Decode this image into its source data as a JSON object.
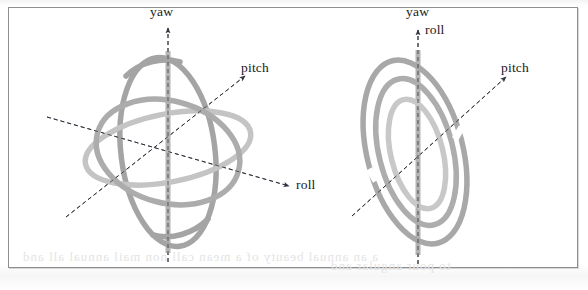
{
  "figure": {
    "caption_present": false,
    "background": "#ffffff",
    "frame_color": "#8e8e8e",
    "panels": [
      {
        "id": "left",
        "name": "gyroscope-normal",
        "description": "Three-axis gimbal with three interlocking rings in general orientation",
        "ring_colors": [
          "#a9a9a9",
          "#b4b4b4",
          "#c9c9c9"
        ],
        "rod_color": "#b0b0b0",
        "axis_color": "#3a3a47",
        "labels": [
          {
            "id": "yaw",
            "text": "yaw",
            "x": 150,
            "y": 6
          },
          {
            "id": "pitch",
            "text": "pitch",
            "x": 241,
            "y": 62
          },
          {
            "id": "roll",
            "text": "roll",
            "x": 297,
            "y": 179
          }
        ]
      },
      {
        "id": "right",
        "name": "gyroscope-gimbal-lock",
        "description": "Gimbal lock configuration: three rings nearly coplanar, yaw and roll axes aligned",
        "ring_colors": [
          "#a9a9a9",
          "#b4b4b4",
          "#c9c9c9"
        ],
        "rod_color": "#b0b0b0",
        "axis_color": "#3a3a47",
        "labels": [
          {
            "id": "yaw",
            "text": "yaw",
            "x": 406,
            "y": 6
          },
          {
            "id": "roll",
            "text": "roll",
            "x": 424,
            "y": 23
          },
          {
            "id": "pitch",
            "text": "pitch",
            "x": 501,
            "y": 62
          }
        ]
      }
    ],
    "bleedthrough": {
      "visible": true,
      "line1": "a an annual beauty of a mean call non mail annual all and",
      "line2": "to pour angular and"
    }
  }
}
